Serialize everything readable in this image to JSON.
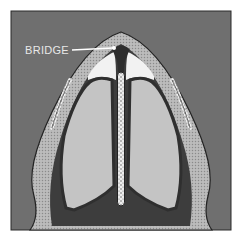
{
  "diagram": {
    "type": "anatomical cross-section",
    "labels": [
      {
        "text": "BRIDGE",
        "points_to": "bridge"
      }
    ]
  },
  "colors": {
    "background": "#6f6f6f",
    "frame_border": "#2a2a2a",
    "outer_band": "#b9b9b9",
    "dark_wall": "#3d3d3d",
    "chamber": "#c4c4c4",
    "white_pocket": "#f2f2f2",
    "septum": "#e6e6e6",
    "label_text": "#e8e8e8"
  }
}
